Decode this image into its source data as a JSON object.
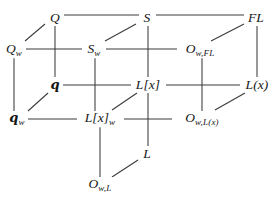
{
  "figure": {
    "type": "commutative-diagram",
    "shape": "cube-lattice",
    "background_color": "#ffffff",
    "line_color": "#3a3a3a",
    "text_color": "#161616",
    "width": 279,
    "height": 200
  },
  "nodes": [
    {
      "id": "Q",
      "label": "Q",
      "base": "Q",
      "sub": "",
      "x": 55,
      "y": 18
    },
    {
      "id": "S",
      "label": "S",
      "base": "S",
      "sub": "",
      "x": 147,
      "y": 18
    },
    {
      "id": "FL",
      "label": "FL",
      "base": "FL",
      "sub": "",
      "x": 256,
      "y": 18
    },
    {
      "id": "Qw",
      "label": "Q_w",
      "base": "Q",
      "sub": "w",
      "x": 14,
      "y": 50
    },
    {
      "id": "Sw",
      "label": "S_w",
      "base": "S",
      "sub": "w",
      "x": 94,
      "y": 50
    },
    {
      "id": "OwFL",
      "label": "O_{w,FL}",
      "base": "O",
      "sub": "w,FL",
      "x": 200,
      "y": 50
    },
    {
      "id": "q",
      "label": "q",
      "base": "q",
      "sub": "",
      "x": 55,
      "y": 85
    },
    {
      "id": "Lx",
      "label": "L[x]",
      "base": "L[x]",
      "sub": "",
      "x": 148,
      "y": 85
    },
    {
      "id": "Lpx",
      "label": "L(x)",
      "base": "L(x)",
      "sub": "",
      "x": 257,
      "y": 85
    },
    {
      "id": "qw",
      "label": "q_w",
      "base": "q",
      "sub": "w",
      "x": 17,
      "y": 119
    },
    {
      "id": "Lxw",
      "label": "L[x]_w",
      "base": "L[x]",
      "sub": "w",
      "x": 100,
      "y": 119
    },
    {
      "id": "OwLx",
      "label": "O_{w,L(x)}",
      "base": "O",
      "sub": "w,L(x)",
      "x": 202,
      "y": 119
    },
    {
      "id": "L",
      "label": "L",
      "base": "L",
      "sub": "",
      "x": 147,
      "y": 154
    },
    {
      "id": "OwL",
      "label": "O_{w,L}",
      "base": "O",
      "sub": "w,L",
      "x": 100,
      "y": 185
    }
  ],
  "edges": [
    {
      "from": "Q",
      "to": "S",
      "kind": "horizontal",
      "x1": 64,
      "y1": 15,
      "x2": 139,
      "y2": 15
    },
    {
      "from": "S",
      "to": "FL",
      "kind": "horizontal",
      "x1": 156,
      "y1": 15,
      "x2": 244,
      "y2": 15
    },
    {
      "from": "Qw",
      "to": "Sw",
      "kind": "horizontal",
      "x1": 26,
      "y1": 49,
      "x2": 82,
      "y2": 49
    },
    {
      "from": "Sw",
      "to": "OwFL",
      "kind": "horizontal",
      "x1": 106,
      "y1": 49,
      "x2": 177,
      "y2": 49
    },
    {
      "from": "q",
      "to": "Lx",
      "kind": "horizontal",
      "x1": 63,
      "y1": 85,
      "x2": 131,
      "y2": 85
    },
    {
      "from": "Lx",
      "to": "Lpx",
      "kind": "horizontal",
      "x1": 166,
      "y1": 85,
      "x2": 240,
      "y2": 85
    },
    {
      "from": "qw",
      "to": "Lxw",
      "kind": "horizontal",
      "x1": 28,
      "y1": 119,
      "x2": 77,
      "y2": 119
    },
    {
      "from": "Lxw",
      "to": "OwLx",
      "kind": "horizontal",
      "x1": 124,
      "y1": 119,
      "x2": 172,
      "y2": 119
    },
    {
      "from": "Q",
      "to": "q",
      "kind": "vertical",
      "x1": 55,
      "y1": 26,
      "x2": 55,
      "y2": 77
    },
    {
      "from": "S",
      "to": "Lx",
      "kind": "vertical",
      "x1": 148,
      "y1": 26,
      "x2": 148,
      "y2": 77
    },
    {
      "from": "FL",
      "to": "Lpx",
      "kind": "vertical",
      "x1": 257,
      "y1": 26,
      "x2": 257,
      "y2": 77
    },
    {
      "from": "Qw",
      "to": "qw",
      "kind": "vertical",
      "x1": 14,
      "y1": 58,
      "x2": 14,
      "y2": 111
    },
    {
      "from": "Sw",
      "to": "Lxw",
      "kind": "vertical",
      "x1": 95,
      "y1": 58,
      "x2": 95,
      "y2": 111
    },
    {
      "from": "OwFL",
      "to": "OwLx",
      "kind": "vertical",
      "x1": 202,
      "y1": 58,
      "x2": 202,
      "y2": 111
    },
    {
      "from": "Lx",
      "to": "L",
      "kind": "vertical",
      "x1": 148,
      "y1": 93,
      "x2": 148,
      "y2": 146
    },
    {
      "from": "Lxw",
      "to": "OwL",
      "kind": "vertical",
      "x1": 100,
      "y1": 127,
      "x2": 100,
      "y2": 177
    },
    {
      "from": "Qw",
      "to": "Q",
      "kind": "diagonal",
      "x1": 25,
      "y1": 41,
      "x2": 45,
      "y2": 24
    },
    {
      "from": "Sw",
      "to": "S",
      "kind": "diagonal",
      "x1": 105,
      "y1": 41,
      "x2": 136,
      "y2": 24
    },
    {
      "from": "OwFL",
      "to": "FL",
      "kind": "diagonal",
      "x1": 211,
      "y1": 41,
      "x2": 244,
      "y2": 24
    },
    {
      "from": "qw",
      "to": "q",
      "kind": "diagonal",
      "x1": 28,
      "y1": 111,
      "x2": 48,
      "y2": 93
    },
    {
      "from": "Lxw",
      "to": "Lx",
      "kind": "diagonal",
      "x1": 112,
      "y1": 110,
      "x2": 137,
      "y2": 93
    },
    {
      "from": "OwLx",
      "to": "Lpx",
      "kind": "diagonal",
      "x1": 215,
      "y1": 110,
      "x2": 245,
      "y2": 93
    },
    {
      "from": "OwL",
      "to": "L",
      "kind": "diagonal",
      "x1": 112,
      "y1": 177,
      "x2": 138,
      "y2": 160
    }
  ]
}
